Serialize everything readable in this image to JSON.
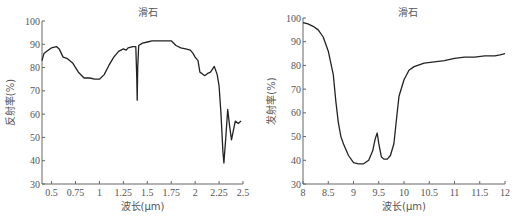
{
  "chart_data": [
    {
      "type": "line",
      "title": "滑石",
      "xlabel": "波长(μm)",
      "ylabel": "反射率(%)",
      "xlim": [
        0.4,
        2.5
      ],
      "ylim": [
        30,
        100
      ],
      "xticks": [
        0.5,
        0.75,
        1,
        1.25,
        1.5,
        1.75,
        2,
        2.25,
        2.5
      ],
      "xtick_labels": [
        "0.5",
        "0.75",
        "1",
        "1.25",
        "1.5",
        "1.75",
        "2",
        "2.25",
        "2.5"
      ],
      "yticks": [
        30,
        40,
        50,
        60,
        70,
        80,
        90,
        100
      ],
      "grid": false,
      "series": [
        {
          "name": "滑石 reflectance",
          "x": [
            0.4,
            0.42,
            0.45,
            0.5,
            0.55,
            0.58,
            0.62,
            0.66,
            0.72,
            0.78,
            0.84,
            0.9,
            0.95,
            1.0,
            1.05,
            1.1,
            1.15,
            1.2,
            1.25,
            1.28,
            1.3,
            1.35,
            1.38,
            1.39,
            1.395,
            1.4,
            1.41,
            1.45,
            1.5,
            1.55,
            1.6,
            1.7,
            1.75,
            1.8,
            1.85,
            1.9,
            1.95,
            1.98,
            2.0,
            2.03,
            2.05,
            2.07,
            2.1,
            2.13,
            2.16,
            2.2,
            2.23,
            2.25,
            2.27,
            2.29,
            2.3,
            2.32,
            2.34,
            2.36,
            2.38,
            2.4,
            2.42,
            2.45,
            2.48
          ],
          "y": [
            83,
            86,
            87,
            88.5,
            89,
            88,
            84.5,
            84,
            82,
            78,
            75.5,
            75.5,
            75,
            75,
            77,
            81,
            84.5,
            87,
            88,
            87.5,
            88.5,
            89,
            89,
            75,
            66,
            80,
            89.5,
            90.5,
            91,
            91.5,
            91.5,
            91.5,
            91.5,
            89.5,
            88.5,
            88,
            87.5,
            86,
            84.5,
            83,
            78,
            77.5,
            76.5,
            77.5,
            78,
            80.5,
            77,
            72,
            60,
            44,
            39,
            50,
            62,
            55,
            49,
            53,
            57,
            56,
            57
          ]
        }
      ]
    },
    {
      "type": "line",
      "title": "滑石",
      "xlabel": "波长(μm)",
      "ylabel": "发射率(%)",
      "xlim": [
        8,
        12
      ],
      "ylim": [
        30,
        100
      ],
      "xticks": [
        8,
        8.5,
        9,
        9.5,
        10,
        10.5,
        11,
        11.5,
        12
      ],
      "xtick_labels": [
        "8",
        "8.5",
        "9",
        "9.5",
        "10",
        "10.5",
        "11",
        "11.5",
        "12"
      ],
      "yticks": [
        30,
        40,
        50,
        60,
        70,
        80,
        90,
        100
      ],
      "grid": false,
      "series": [
        {
          "name": "滑石 emissivity",
          "x": [
            8.0,
            8.1,
            8.2,
            8.3,
            8.4,
            8.5,
            8.6,
            8.65,
            8.7,
            8.75,
            8.8,
            8.9,
            9.0,
            9.1,
            9.2,
            9.3,
            9.38,
            9.43,
            9.47,
            9.5,
            9.55,
            9.6,
            9.67,
            9.73,
            9.8,
            9.85,
            9.9,
            10.0,
            10.1,
            10.2,
            10.4,
            10.6,
            10.8,
            11.0,
            11.2,
            11.4,
            11.6,
            11.8,
            11.9,
            12.0
          ],
          "y": [
            98,
            97.5,
            96.5,
            95,
            92,
            86,
            76,
            65,
            56,
            50,
            47,
            42,
            39,
            38.5,
            38.5,
            40,
            44,
            49,
            51.5,
            47,
            41.5,
            40.5,
            40.5,
            42,
            47,
            57,
            67,
            74,
            78,
            79.5,
            81,
            81.5,
            82,
            83,
            83.5,
            83.5,
            84,
            84,
            84.5,
            85
          ]
        }
      ]
    }
  ]
}
